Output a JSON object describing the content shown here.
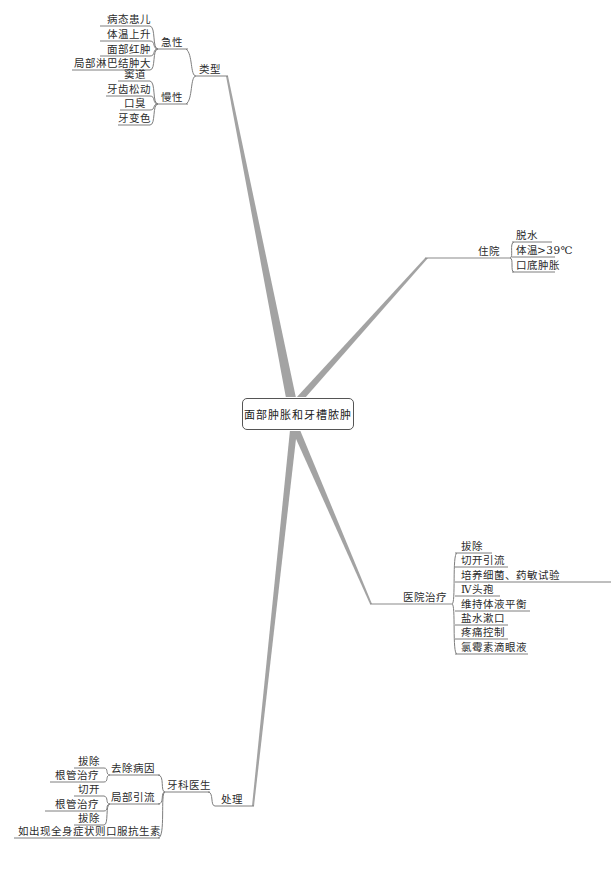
{
  "central_topic": "面部肿胀和牙槽脓肿",
  "branches": {
    "types": {
      "label": "类型",
      "acute": {
        "label": "急性",
        "items": [
          "病态患儿",
          "体温上升",
          "面部红肿",
          "局部淋巴结肿大"
        ]
      },
      "chronic": {
        "label": "慢性",
        "items": [
          "窦道",
          "牙齿松动",
          "口臭",
          "牙变色"
        ]
      }
    },
    "hospitalization": {
      "label": "住院",
      "items": [
        "脱水",
        "体温>39℃",
        "口底肿胀"
      ]
    },
    "hospital_treatment": {
      "label": "医院治疗",
      "items": [
        "拔除",
        "切开引流",
        "培养细菌、药敏试验",
        "Ⅳ头孢",
        "维持体液平衡",
        "盐水漱口",
        "疼痛控制",
        "氯霉素滴眼液"
      ]
    },
    "management": {
      "label": "处理",
      "dentist": {
        "label": "牙科医生",
        "remove_cause": {
          "label": "去除病因",
          "items": [
            "拔除",
            "根管治疗"
          ]
        },
        "local_drainage": {
          "label": "局部引流",
          "items": [
            "切开",
            "根管治疗",
            "拔除"
          ]
        },
        "systemic": "如出现全身症状则口服抗生素"
      }
    }
  },
  "colors": {
    "line": "#8a8a8a",
    "branch": "#a0a0a0",
    "text": "#2b2b2b",
    "node_border": "#555555"
  }
}
